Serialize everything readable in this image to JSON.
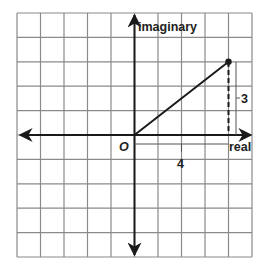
{
  "diagram": {
    "type": "complex-plane",
    "axes": {
      "horizontal_label": "real",
      "vertical_label": "imaginary",
      "origin_label": "O"
    },
    "grid": {
      "columns": 10,
      "rows": 10,
      "x_min": -5,
      "x_max": 5,
      "y_min": -5,
      "y_max": 5
    },
    "point": {
      "real": 4,
      "imaginary": 3
    },
    "annotations": {
      "horizontal_length": "4",
      "vertical_length": "3"
    },
    "colors": {
      "grid": "#8a8a8a",
      "axis": "#1a1a1a",
      "vector": "#1a1a1a",
      "background": "#ffffff"
    }
  }
}
